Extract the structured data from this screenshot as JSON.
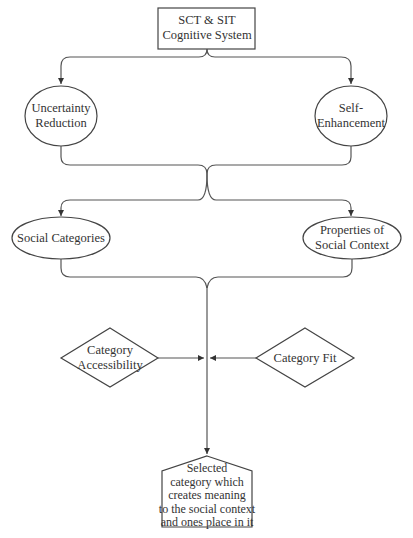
{
  "diagram": {
    "type": "flowchart",
    "nodes": {
      "root": {
        "line1": "SCT & SIT",
        "line2": "Cognitive System",
        "shape": "rectangle"
      },
      "uncertainty": {
        "line1": "Uncertainty",
        "line2": "Reduction",
        "shape": "ellipse"
      },
      "self": {
        "line1": "Self-",
        "line2": "Enhancement",
        "shape": "ellipse"
      },
      "social_categories": {
        "line1": "Social Categories",
        "shape": "ellipse"
      },
      "properties": {
        "line1": "Properties of",
        "line2": "Social Context",
        "shape": "ellipse"
      },
      "accessibility": {
        "line1": "Category",
        "line2": "Accessibility",
        "shape": "diamond"
      },
      "fit": {
        "line1": "Category Fit",
        "shape": "diamond"
      },
      "selected": {
        "line1": "Selected",
        "line2": "category which",
        "line3": "creates meaning",
        "line4": "to the social context",
        "line5": "and ones place in it",
        "shape": "pentagon"
      }
    },
    "edges": [
      {
        "from": "root",
        "to": "uncertainty"
      },
      {
        "from": "root",
        "to": "self"
      },
      {
        "from": "uncertainty",
        "to": "social_categories"
      },
      {
        "from": "uncertainty",
        "to": "properties"
      },
      {
        "from": "self",
        "to": "social_categories"
      },
      {
        "from": "self",
        "to": "properties"
      },
      {
        "from": "social_categories",
        "to": "selected"
      },
      {
        "from": "properties",
        "to": "selected"
      },
      {
        "from": "accessibility",
        "to": "selected"
      },
      {
        "from": "fit",
        "to": "selected"
      }
    ],
    "colors": {
      "stroke": "#444444",
      "text": "#333333",
      "background": "#ffffff"
    }
  }
}
